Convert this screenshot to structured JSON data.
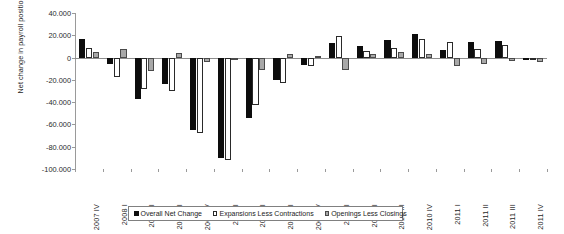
{
  "chart_data": {
    "type": "bar",
    "title": "",
    "xlabel": "",
    "ylabel": "Net change in payroll positions",
    "ylim": [
      -100000,
      40000
    ],
    "ytick_values": [
      40000,
      20000,
      0,
      -20000,
      -40000,
      -60000,
      -80000,
      -100000
    ],
    "ytick_labels": [
      "40.000",
      "20.000",
      "0",
      "-20.000",
      "-40.000",
      "-60.000",
      "-80.000",
      "-100.000"
    ],
    "grid": false,
    "legend_position": "bottom",
    "categories": [
      "2007 IV",
      "2008 I",
      "2008 II",
      "2008 III",
      "2008 IV",
      "2009 I",
      "2009 II",
      "2009 III",
      "2009 IV",
      "2010 I",
      "2010 II",
      "2010 III",
      "2010 IV",
      "2011 I",
      "2011 II",
      "2011 III",
      "2011 IV"
    ],
    "series": [
      {
        "name": "Overall Net Change",
        "color": "#0d0d0d",
        "values": [
          17000,
          -6000,
          -37000,
          -24000,
          -65000,
          -90000,
          -54000,
          -20000,
          -7000,
          13000,
          10000,
          16000,
          21000,
          7000,
          14000,
          15000,
          -1000
        ]
      },
      {
        "name": "Expansions Less Contractions",
        "color": "#ffffff",
        "values": [
          9000,
          -17000,
          -28000,
          -30000,
          -68000,
          -92000,
          -43000,
          -23000,
          -8000,
          19000,
          6000,
          9000,
          17000,
          14000,
          8000,
          11000,
          -2000
        ]
      },
      {
        "name": "Openings Less Closings",
        "color": "#a8a8a8",
        "values": [
          5000,
          8000,
          -12000,
          4000,
          -4000,
          -1000,
          -11000,
          3000,
          1000,
          -11000,
          3000,
          5000,
          3000,
          -8000,
          -6000,
          -3000,
          -4000
        ]
      }
    ]
  },
  "legend": {
    "items": [
      {
        "label": "Overall Net Change",
        "swatch": "filled-black-square-icon"
      },
      {
        "label": "Expansions Less Contractions",
        "swatch": "outlined-white-square-icon"
      },
      {
        "label": "Openings Less Closings",
        "swatch": "filled-gray-square-icon"
      }
    ]
  },
  "axes": {
    "y_title": "Net change in payroll positions"
  }
}
